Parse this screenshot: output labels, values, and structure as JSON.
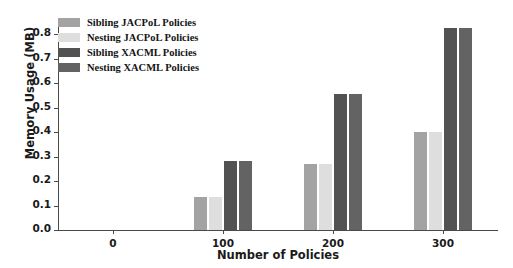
{
  "chart_data": {
    "type": "bar",
    "title": "",
    "xlabel": "Number of Policies",
    "ylabel": "Memory Usage (MB)",
    "categories": [
      "0",
      "100",
      "200",
      "300"
    ],
    "ylim": [
      0.0,
      0.85
    ],
    "yticks": [
      "0.0",
      "0.1",
      "0.2",
      "0.3",
      "0.4",
      "0.5",
      "0.6",
      "0.7",
      "0.8"
    ],
    "ytick_values": [
      0.0,
      0.1,
      0.2,
      0.3,
      0.4,
      0.5,
      0.6,
      0.7,
      0.8
    ],
    "grid": false,
    "legend_position": "upper-left-inside",
    "series": [
      {
        "name": "Sibling JACPoL Policies",
        "color": "#a3a3a3",
        "values": [
          0.0,
          0.135,
          0.27,
          0.4
        ]
      },
      {
        "name": "Nesting JACPoL Policies",
        "color": "#dedede",
        "values": [
          0.0,
          0.135,
          0.27,
          0.4
        ]
      },
      {
        "name": "Sibling XACML Policies",
        "color": "#525252",
        "values": [
          0.0,
          0.28,
          0.555,
          0.825
        ]
      },
      {
        "name": "Nesting XACML Policies",
        "color": "#636363",
        "values": [
          0.0,
          0.28,
          0.555,
          0.825
        ]
      }
    ]
  }
}
